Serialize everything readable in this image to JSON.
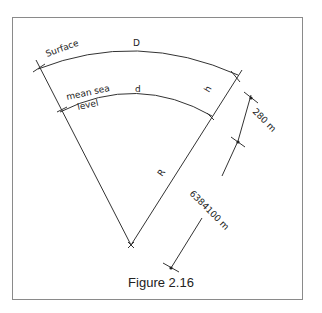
{
  "figure": {
    "caption": "Figure 2.16",
    "labels": {
      "surface": "Surface",
      "surface_arc": "D",
      "msl_line1": "mean sea",
      "msl_line2": "level",
      "msl_arc": "d",
      "height": "h",
      "radius": "R",
      "height_dim": "280 m",
      "radius_dim": "6384100 m"
    },
    "colors": {
      "line": "#333333",
      "frame": "#8a8a8a"
    }
  }
}
